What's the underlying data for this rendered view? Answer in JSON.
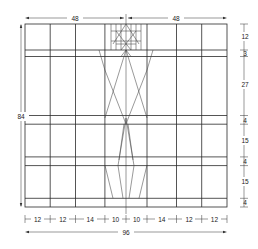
{
  "diagram": {
    "overall_width_label": "96",
    "overall_height_label": "84",
    "top_halves": [
      "48",
      "48"
    ],
    "bottom_segments": [
      "12",
      "12",
      "14",
      "10",
      "10",
      "14",
      "12",
      "12"
    ],
    "right_segments": [
      "12",
      "3",
      "27",
      "4",
      "15",
      "4",
      "15",
      "4"
    ]
  }
}
